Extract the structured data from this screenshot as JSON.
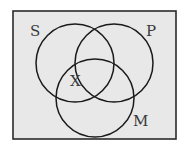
{
  "diagram": {
    "type": "venn",
    "colors": {
      "background": "#e8e8e8",
      "stroke": "#1a1a1a",
      "label": "#3a3a3a"
    },
    "sets": [
      {
        "id": "S",
        "label": "S"
      },
      {
        "id": "P",
        "label": "P"
      },
      {
        "id": "M",
        "label": "M"
      }
    ],
    "marks": [
      {
        "label": "X",
        "region": "S ∩ M, outside P"
      }
    ]
  }
}
